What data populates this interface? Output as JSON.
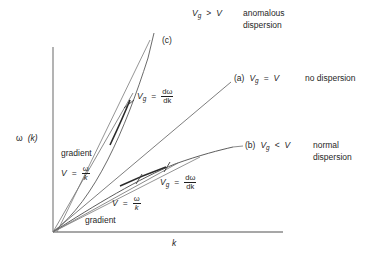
{
  "figure": {
    "type": "dispersion-relation-diagram",
    "background": "#ffffff",
    "stroke_color": "#4a4a4a",
    "axis_color": "#7a7a7a",
    "width": 377,
    "height": 258
  },
  "axes": {
    "y_label_omega": "ω",
    "y_label_arg": "(k)",
    "x_label": "k",
    "origin": [
      53,
      232
    ],
    "x_axis_end": [
      283,
      232
    ],
    "y_axis_top": [
      53,
      47
    ]
  },
  "curves": {
    "a": {
      "id": "(a)",
      "label_id": "(a)",
      "relation": "V",
      "relation_sub": "g",
      "operator": "=",
      "rhs": "V",
      "dispersion": "no dispersion",
      "shape": "straight-line"
    },
    "b": {
      "id": "(b)",
      "label_id": "(b)",
      "relation": "V",
      "relation_sub": "g",
      "operator": "<",
      "rhs": "V",
      "dispersion_line1": "normal",
      "dispersion_line2": "dispersion",
      "shape": "concave-down"
    },
    "c": {
      "id": "(c)",
      "label_id": "(c)",
      "relation": "V",
      "relation_sub": "g",
      "operator": ">",
      "rhs": "V",
      "dispersion_line1": "anomalous",
      "dispersion_line2": "dispersion",
      "shape": "concave-up"
    }
  },
  "annotations": {
    "group_velocity_upper": {
      "symbol": "V",
      "symbol_sub": "g",
      "equals": "=",
      "numerator": "dω",
      "denominator": "dk"
    },
    "group_velocity_lower": {
      "symbol": "V",
      "symbol_sub": "g",
      "equals": "=",
      "numerator": "dω",
      "denominator": "dk"
    },
    "phase_velocity_upper": {
      "gradient_word": "gradient",
      "symbol": "V",
      "equals": "=",
      "numerator": "ω",
      "denominator": "k"
    },
    "phase_velocity_lower": {
      "gradient_word": "gradient",
      "symbol": "V",
      "equals": "=",
      "numerator": "ω",
      "denominator": "k"
    }
  }
}
